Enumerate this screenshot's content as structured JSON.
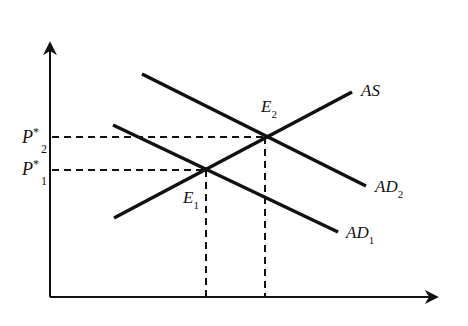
{
  "diagram": {
    "type": "AS-AD supply and demand shift diagram",
    "axes": {
      "origin": [
        50,
        297
      ],
      "y_axis_top": [
        50,
        40
      ],
      "x_axis_right": [
        440,
        297
      ],
      "y_label": "",
      "x_label": ""
    },
    "curves": [
      {
        "id": "AS",
        "label": "AS",
        "subscript": "",
        "x1": 114,
        "y1": 218,
        "x2": 352,
        "y2": 92,
        "label_x": 361,
        "label_y": 96
      },
      {
        "id": "AD1",
        "label": "AD",
        "subscript": "1",
        "x1": 113,
        "y1": 125,
        "x2": 338,
        "y2": 232,
        "label_x": 346,
        "label_y": 238
      },
      {
        "id": "AD2",
        "label": "AD",
        "subscript": "2",
        "x1": 142,
        "y1": 74,
        "x2": 366,
        "y2": 186,
        "label_x": 375,
        "label_y": 192
      }
    ],
    "equilibria": [
      {
        "id": "E1",
        "label": "E",
        "subscript": "1",
        "x": 206,
        "y": 170,
        "label_x": 183,
        "label_y": 203
      },
      {
        "id": "E2",
        "label": "E",
        "subscript": "2",
        "x": 265,
        "y": 137,
        "label_x": 261,
        "label_y": 112
      }
    ],
    "price_labels": [
      {
        "id": "P1",
        "label": "P",
        "superscript": "*",
        "subscript": "1",
        "y": 170
      },
      {
        "id": "P2",
        "label": "P",
        "superscript": "*",
        "subscript": "2",
        "y": 137
      }
    ],
    "colors": {
      "line": "#111111",
      "background": "#ffffff"
    }
  }
}
